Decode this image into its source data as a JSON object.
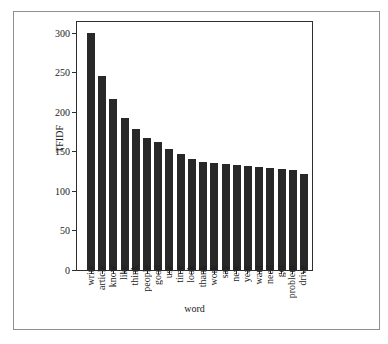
{
  "figure": {
    "background": "#ffffff",
    "frame_color": "#8f8f8f",
    "axis_color": "#2e2e2e",
    "bar_color": "#282828",
    "text_color": "#1c1c1c"
  },
  "chart_data": {
    "type": "bar",
    "title": "",
    "xlabel": "word",
    "ylabel": "TFIDF",
    "categories": [
      "write",
      "article",
      "know",
      "like",
      "think",
      "people",
      "good",
      "use",
      "time",
      "look",
      "thank",
      "work",
      "say",
      "new",
      "year",
      "want",
      "need",
      "get",
      "problem",
      "drive"
    ],
    "values": [
      300,
      246,
      216,
      192,
      178,
      167,
      162,
      153,
      147,
      140,
      137,
      135,
      134,
      133,
      132,
      130,
      129,
      128,
      127,
      122
    ],
    "ylim": [
      0,
      314
    ],
    "yticks": [
      0,
      50,
      100,
      150,
      200,
      250,
      300
    ],
    "grid": false,
    "legend": null,
    "bar_orientation": "vertical"
  }
}
